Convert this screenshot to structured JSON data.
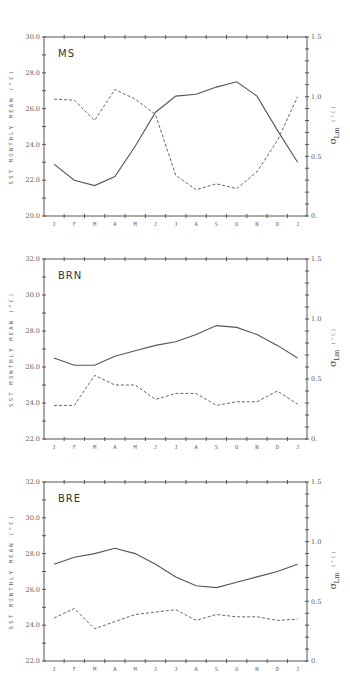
{
  "figure": {
    "left_axis_title": "SST MONTHLY MEAN (°C)",
    "right_axis_title_symbol": "σ",
    "right_axis_title_sub": "Lm",
    "right_axis_title_unit": "(°C)"
  },
  "chart_data": [
    {
      "type": "line",
      "title": "MS",
      "categories": [
        "J",
        "F",
        "M",
        "A",
        "M",
        "J",
        "J",
        "A",
        "S",
        "O",
        "N",
        "D",
        "J"
      ],
      "xlabel": "",
      "ylabel": "SST MONTHLY MEAN (°C)",
      "ylabel_right": "σ Lm (°C)",
      "ylim": [
        20.0,
        30.0
      ],
      "ylim_right": [
        0.0,
        1.5
      ],
      "yticks": [
        "20.0",
        "22.0",
        "24.0",
        "26.0",
        "28.0",
        "30.0"
      ],
      "yticks_right": [
        "0.",
        "0.5",
        "1.0",
        "1.5"
      ],
      "grid": false,
      "series": [
        {
          "name": "SST monthly mean",
          "axis": "left",
          "style": "solid",
          "values": [
            22.9,
            22.0,
            21.7,
            22.2,
            23.9,
            25.8,
            26.7,
            26.8,
            27.2,
            27.5,
            26.7,
            24.8,
            23.0
          ]
        },
        {
          "name": "σ Lm",
          "axis": "right",
          "style": "dashed",
          "values": [
            0.98,
            0.97,
            0.8,
            1.06,
            0.98,
            0.85,
            0.34,
            0.22,
            0.27,
            0.23,
            0.37,
            0.63,
            1.0
          ]
        }
      ]
    },
    {
      "type": "line",
      "title": "BRN",
      "categories": [
        "J",
        "F",
        "M",
        "A",
        "M",
        "J",
        "J",
        "A",
        "S",
        "O",
        "N",
        "D",
        "J"
      ],
      "xlabel": "",
      "ylabel": "SST MONTHLY MEAN (°C)",
      "ylabel_right": "σ Lm (°C)",
      "ylim": [
        22.0,
        32.0
      ],
      "ylim_right": [
        0.0,
        1.5
      ],
      "yticks": [
        "22.0",
        "24.0",
        "26.0",
        "28.0",
        "30.0",
        "32.0"
      ],
      "yticks_right": [
        "0.",
        "0.5",
        "1.0",
        "1.5"
      ],
      "grid": false,
      "series": [
        {
          "name": "SST monthly mean",
          "axis": "left",
          "style": "solid",
          "values": [
            26.5,
            26.1,
            26.1,
            26.6,
            26.9,
            27.2,
            27.4,
            27.8,
            28.3,
            28.2,
            27.8,
            27.2,
            26.5
          ]
        },
        {
          "name": "σ Lm",
          "axis": "right",
          "style": "dashed",
          "values": [
            0.28,
            0.28,
            0.53,
            0.45,
            0.45,
            0.33,
            0.38,
            0.38,
            0.28,
            0.31,
            0.31,
            0.4,
            0.29
          ]
        }
      ]
    },
    {
      "type": "line",
      "title": "BRE",
      "categories": [
        "J",
        "F",
        "M",
        "A",
        "M",
        "J",
        "J",
        "A",
        "S",
        "O",
        "N",
        "D",
        "J"
      ],
      "xlabel": "",
      "ylabel": "SST MONTHLY MEAN (°C)",
      "ylabel_right": "σ Lm (°C)",
      "ylim": [
        22.0,
        32.0
      ],
      "ylim_right": [
        0.0,
        1.5
      ],
      "yticks": [
        "22.0",
        "24.0",
        "26.0",
        "28.0",
        "30.0",
        "32.0"
      ],
      "yticks_right": [
        "0.",
        "0.5",
        "1.0",
        "1.5"
      ],
      "grid": false,
      "series": [
        {
          "name": "SST monthly mean",
          "axis": "left",
          "style": "solid",
          "values": [
            27.4,
            27.8,
            28.0,
            28.3,
            28.0,
            27.4,
            26.7,
            26.2,
            26.1,
            26.4,
            26.7,
            27.0,
            27.4
          ]
        },
        {
          "name": "σ Lm",
          "axis": "right",
          "style": "dashed",
          "values": [
            0.36,
            0.44,
            0.27,
            0.33,
            0.39,
            0.41,
            0.43,
            0.34,
            0.39,
            0.37,
            0.37,
            0.34,
            0.35
          ]
        }
      ]
    }
  ]
}
